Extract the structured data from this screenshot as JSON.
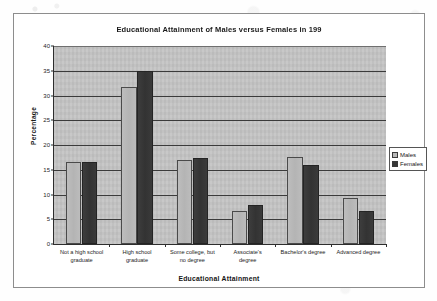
{
  "chart_data": {
    "type": "bar",
    "title": "Educational Attainment of Males versus Females in 199",
    "xlabel": "Educational Attainment",
    "ylabel": "Percentage",
    "ylim": [
      0,
      40
    ],
    "yticks": [
      0,
      5,
      10,
      15,
      20,
      25,
      30,
      35,
      40
    ],
    "grid": true,
    "legend_position": "right",
    "categories": [
      "Not a high school\ngraduate",
      "High school\ngraduate",
      "Some college, but\nno degree",
      "Associate's\ndegree",
      "Bachelor's degree",
      "Advanced degree"
    ],
    "series": [
      {
        "name": "Males",
        "color": "#b8b8b8",
        "values": [
          16.6,
          31.8,
          16.9,
          6.7,
          17.6,
          9.3
        ]
      },
      {
        "name": "Females",
        "color": "#373737",
        "values": [
          16.5,
          34.9,
          17.3,
          7.9,
          15.9,
          6.6
        ]
      }
    ]
  },
  "colors": {
    "plot_background": "#c3c3c3",
    "gridline": "#3b3b3b",
    "frame_border": "#8d8d8d",
    "males_bar": "#b8b8b8",
    "females_bar": "#373737"
  }
}
